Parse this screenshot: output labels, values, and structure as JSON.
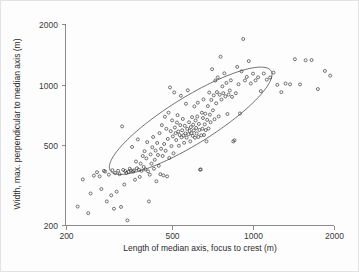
{
  "chart_data": {
    "type": "scatter",
    "title": "",
    "xlabel": "Length of median axis, focus to crest (m)",
    "ylabel": "Width, max. perpendicular to median axis (m)",
    "xscale": "log",
    "yscale": "log",
    "xlim": [
      200,
      2000
    ],
    "ylim": [
      200,
      2000
    ],
    "xticks": [
      200,
      500,
      1000,
      2000
    ],
    "xticklabels": [
      "200",
      "500",
      "1000",
      "2000"
    ],
    "yticks": [
      200,
      500,
      1000,
      2000
    ],
    "yticklabels": [
      "200",
      "500",
      "1000",
      "2000"
    ],
    "grid": false,
    "legend": null,
    "marker": "open-circle",
    "marker_color": "#2e2e2e",
    "marker_size": 3,
    "overlay": {
      "type": "ellipse",
      "description": "concentration ellipse enclosing the main cluster",
      "center_x": 585,
      "center_y": 660,
      "semi_major_log_x": 0.295,
      "semi_major_log_y": 0.255,
      "semi_minor": 0.105,
      "rotation_note": "major axis oriented along the positive regression trend",
      "stroke": "#333333"
    },
    "n_points": 171,
    "points": [
      [
        222,
        247
      ],
      [
        232,
        337
      ],
      [
        243,
        229
      ],
      [
        248,
        287
      ],
      [
        255,
        352
      ],
      [
        262,
        366
      ],
      [
        268,
        349
      ],
      [
        272,
        302
      ],
      [
        278,
        372
      ],
      [
        281,
        369
      ],
      [
        285,
        262
      ],
      [
        290,
        356
      ],
      [
        296,
        281
      ],
      [
        299,
        375
      ],
      [
        303,
        241
      ],
      [
        306,
        363
      ],
      [
        310,
        293
      ],
      [
        314,
        372
      ],
      [
        318,
        358
      ],
      [
        322,
        246
      ],
      [
        325,
        619
      ],
      [
        328,
        376
      ],
      [
        331,
        318
      ],
      [
        334,
        371
      ],
      [
        337,
        363
      ],
      [
        340,
        211
      ],
      [
        344,
        368
      ],
      [
        347,
        381
      ],
      [
        350,
        373
      ],
      [
        354,
        489
      ],
      [
        357,
        369
      ],
      [
        360,
        374
      ],
      [
        363,
        336
      ],
      [
        366,
        414
      ],
      [
        369,
        383
      ],
      [
        372,
        533
      ],
      [
        375,
        377
      ],
      [
        378,
        347
      ],
      [
        381,
        404
      ],
      [
        384,
        372
      ],
      [
        388,
        441
      ],
      [
        391,
        389
      ],
      [
        394,
        466
      ],
      [
        397,
        378
      ],
      [
        400,
        429
      ],
      [
        403,
        517
      ],
      [
        406,
        370
      ],
      [
        409,
        262
      ],
      [
        412,
        356
      ],
      [
        415,
        449
      ],
      [
        418,
        404
      ],
      [
        421,
        487
      ],
      [
        424,
        548
      ],
      [
        427,
        381
      ],
      [
        430,
        422
      ],
      [
        433,
        469
      ],
      [
        436,
        330
      ],
      [
        439,
        512
      ],
      [
        442,
        446
      ],
      [
        445,
        394
      ],
      [
        448,
        573
      ],
      [
        451,
        358
      ],
      [
        454,
        479
      ],
      [
        457,
        628
      ],
      [
        460,
        441
      ],
      [
        463,
        353
      ],
      [
        466,
        506
      ],
      [
        469,
        691
      ],
      [
        472,
        468
      ],
      [
        475,
        602
      ],
      [
        478,
        349
      ],
      [
        481,
        536
      ],
      [
        484,
        724
      ],
      [
        487,
        431
      ],
      [
        490,
        967
      ],
      [
        493,
        586
      ],
      [
        496,
        494
      ],
      [
        499,
        663
      ],
      [
        502,
        552
      ],
      [
        505,
        455
      ],
      [
        508,
        913
      ],
      [
        511,
        611
      ],
      [
        514,
        573
      ],
      [
        517,
        529
      ],
      [
        520,
        647
      ],
      [
        523,
        704
      ],
      [
        526,
        584
      ],
      [
        529,
        496
      ],
      [
        532,
        561
      ],
      [
        535,
        628
      ],
      [
        538,
        879
      ],
      [
        541,
        546
      ],
      [
        544,
        592
      ],
      [
        547,
        674
      ],
      [
        550,
        558
      ],
      [
        553,
        513
      ],
      [
        556,
        623
      ],
      [
        559,
        571
      ],
      [
        562,
        802
      ],
      [
        565,
        544
      ],
      [
        568,
        602
      ],
      [
        571,
        936
      ],
      [
        574,
        566
      ],
      [
        577,
        649
      ],
      [
        580,
        588
      ],
      [
        583,
        521
      ],
      [
        586,
        614
      ],
      [
        589,
        572
      ],
      [
        592,
        688
      ],
      [
        595,
        556
      ],
      [
        598,
        631
      ],
      [
        601,
        591
      ],
      [
        604,
        778
      ],
      [
        607,
        544
      ],
      [
        610,
        662
      ],
      [
        613,
        608
      ],
      [
        616,
        571
      ],
      [
        619,
        693
      ],
      [
        622,
        812
      ],
      [
        625,
        548
      ],
      [
        628,
        636
      ],
      [
        631,
        594
      ],
      [
        634,
        377
      ],
      [
        638,
        378
      ],
      [
        641,
        559
      ],
      [
        644,
        724
      ],
      [
        647,
        602
      ],
      [
        650,
        681
      ],
      [
        653,
        843
      ],
      [
        656,
        561
      ],
      [
        660,
        633
      ],
      [
        663,
        716
      ],
      [
        666,
        593
      ],
      [
        670,
        521
      ],
      [
        674,
        667
      ],
      [
        678,
        781
      ],
      [
        682,
        604
      ],
      [
        686,
        912
      ],
      [
        690,
        708
      ],
      [
        694,
        649
      ],
      [
        698,
        838
      ],
      [
        703,
        1192
      ],
      [
        708,
        744
      ],
      [
        713,
        883
      ],
      [
        718,
        672
      ],
      [
        723,
        1046
      ],
      [
        728,
        806
      ],
      [
        733,
        917
      ],
      [
        738,
        1085
      ],
      [
        744,
        694
      ],
      [
        750,
        889
      ],
      [
        756,
        1374
      ],
      [
        762,
        842
      ],
      [
        768,
        979
      ],
      [
        774,
        906
      ],
      [
        781,
        1137
      ],
      [
        788,
        873
      ],
      [
        795,
        1018
      ],
      [
        802,
        713
      ],
      [
        810,
        891
      ],
      [
        818,
        934
      ],
      [
        826,
        1049
      ],
      [
        834,
        868
      ],
      [
        843,
        521
      ],
      [
        852,
        528
      ],
      [
        862,
        905
      ],
      [
        872,
        1224
      ],
      [
        882,
        1003
      ],
      [
        893,
        718
      ],
      [
        905,
        1163
      ],
      [
        918,
        1684
      ],
      [
        932,
        1048
      ],
      [
        947,
        1091
      ],
      [
        963,
        1307
      ],
      [
        980,
        1012
      ],
      [
        999,
        1132
      ],
      [
        1020,
        1048
      ],
      [
        1043,
        1086
      ],
      [
        1068,
        927
      ],
      [
        1095,
        1134
      ],
      [
        1124,
        1057
      ],
      [
        1156,
        1083
      ],
      [
        1191,
        1146
      ],
      [
        1230,
        996
      ],
      [
        1273,
        916
      ],
      [
        1320,
        1011
      ],
      [
        1372,
        1002
      ],
      [
        1430,
        1336
      ],
      [
        1495,
        1001
      ],
      [
        1568,
        1320
      ],
      [
        1650,
        1323
      ],
      [
        1742,
        949
      ],
      [
        1850,
        1168
      ],
      [
        1935,
        1107
      ]
    ]
  },
  "axis": {
    "x_title": "Length of median axis, focus to crest (m)",
    "y_title": "Width, max. perpendicular to median axis (m)"
  }
}
